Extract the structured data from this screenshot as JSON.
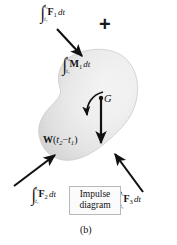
{
  "figure": {
    "caption": "(b)",
    "background_color": "#ffffff",
    "body_fill_light": "#f2f2f2",
    "body_fill_dark": "#d9d9d9",
    "stroke_color": "#1a1a1a"
  },
  "operator": {
    "plus": "+"
  },
  "labels": {
    "force_1": {
      "integral": "∫",
      "upper_limit": "t₂",
      "lower_limit": "t₁",
      "quantity": "F",
      "quantity_sub": "1",
      "differential": "dt",
      "text": "∫ F₁ dt"
    },
    "moment_1": {
      "integral": "∫",
      "upper_limit": "t₂",
      "lower_limit": "t₁",
      "quantity": "M",
      "quantity_sub": "1",
      "differential": "dt",
      "text": "∫ M₁ dt"
    },
    "force_2": {
      "integral": "∫",
      "upper_limit": "t₂",
      "lower_limit": "t₁",
      "quantity": "F",
      "quantity_sub": "2",
      "differential": "dt",
      "text": "∫ F₂ dt"
    },
    "force_3": {
      "integral": "∫",
      "upper_limit": "t₂",
      "lower_limit": "t₁",
      "quantity": "F",
      "quantity_sub": "3",
      "differential": "dt",
      "text": "∫ F₃ dt"
    },
    "center_of_mass": "G",
    "weight_impulse": {
      "quantity": "W",
      "open": "(",
      "t2": "t",
      "t2_sub": "2",
      "minus": "−",
      "t1": "t",
      "t1_sub": "1",
      "close": ")",
      "text": "W(t₂ − t₁)"
    }
  },
  "impulse_box": {
    "line1": "Impulse",
    "line2": "diagram"
  },
  "arrows": {
    "force_1_arrow": "arrow pointing down-right into body",
    "force_2_arrow": "arrow pointing up-right into body",
    "force_3_arrow": "arrow pointing up-left into body",
    "weight_arrow": "vertical arrow pointing down from G",
    "moment_arrow": "curved arrow counterclockwise around G"
  }
}
